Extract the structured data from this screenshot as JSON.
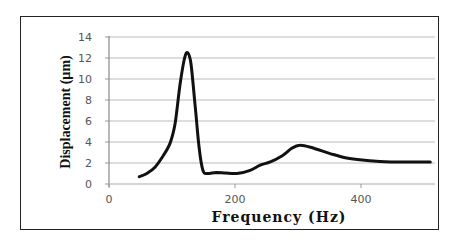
{
  "chart_data": {
    "type": "line",
    "title": "",
    "xlabel": "Frequency (Hz)",
    "ylabel": "Displacement (µm)",
    "xlim": [
      0,
      500
    ],
    "ylim": [
      0,
      14
    ],
    "x_ticks": [
      0,
      200,
      400
    ],
    "y_ticks": [
      0,
      2,
      4,
      6,
      8,
      10,
      12,
      14
    ],
    "grid": "horizontal",
    "legend": null,
    "series": [
      {
        "name": "Displacement",
        "color": "#111111",
        "x": [
          48,
          60,
          73,
          85,
          97,
          105,
          113,
          120,
          125,
          130,
          137,
          143,
          149,
          156,
          170,
          185,
          203,
          224,
          240,
          256,
          275,
          290,
          303,
          320,
          351,
          375,
          398,
          430,
          470,
          510
        ],
        "y": [
          0.7,
          1.0,
          1.6,
          2.6,
          3.9,
          5.8,
          9.6,
          12.0,
          12.5,
          11.5,
          7.3,
          3.5,
          1.3,
          1.0,
          1.1,
          1.05,
          1.0,
          1.3,
          1.8,
          2.1,
          2.7,
          3.4,
          3.7,
          3.5,
          2.9,
          2.5,
          2.3,
          2.15,
          2.1,
          2.1
        ]
      }
    ]
  }
}
